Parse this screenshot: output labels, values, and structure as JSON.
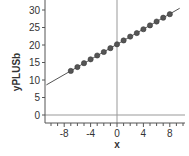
{
  "chart_data": {
    "type": "scatter",
    "title": "",
    "xlabel": "x",
    "ylabel": "yPLUSb",
    "xlim": [
      -10.7,
      10.2
    ],
    "ylim": [
      -2.3,
      32
    ],
    "x_ticks": [
      -8,
      -4,
      0,
      4,
      8
    ],
    "x_tick_labels": [
      "-8",
      "-4",
      "0",
      "4",
      "8"
    ],
    "y_ticks": [
      0,
      5,
      10,
      15,
      20,
      25,
      30
    ],
    "y_tick_labels": [
      "0",
      "5",
      "10",
      "15",
      "20",
      "25",
      "30"
    ],
    "grid": false,
    "reference_lines": {
      "vertical_at_x": 0,
      "horizontal_at_y": 0
    },
    "series": [
      {
        "name": "points",
        "kind": "scatter",
        "x": [
          -7,
          -6,
          -5,
          -4,
          -3,
          -2,
          -1,
          0,
          1,
          2,
          3,
          4,
          5,
          6,
          7,
          8
        ],
        "y": [
          12.6,
          13.7,
          14.8,
          15.9,
          17.0,
          18.0,
          19.1,
          20.2,
          21.3,
          22.4,
          23.4,
          24.5,
          25.6,
          26.7,
          27.8,
          28.8
        ]
      },
      {
        "name": "fit-line",
        "kind": "line",
        "x": [
          -10.7,
          9.5
        ],
        "y": [
          8.6,
          30.5
        ]
      }
    ],
    "colors": {
      "points": "#555555",
      "line": "#555555",
      "axes": "#555555",
      "ref_lines": "#999999"
    }
  }
}
